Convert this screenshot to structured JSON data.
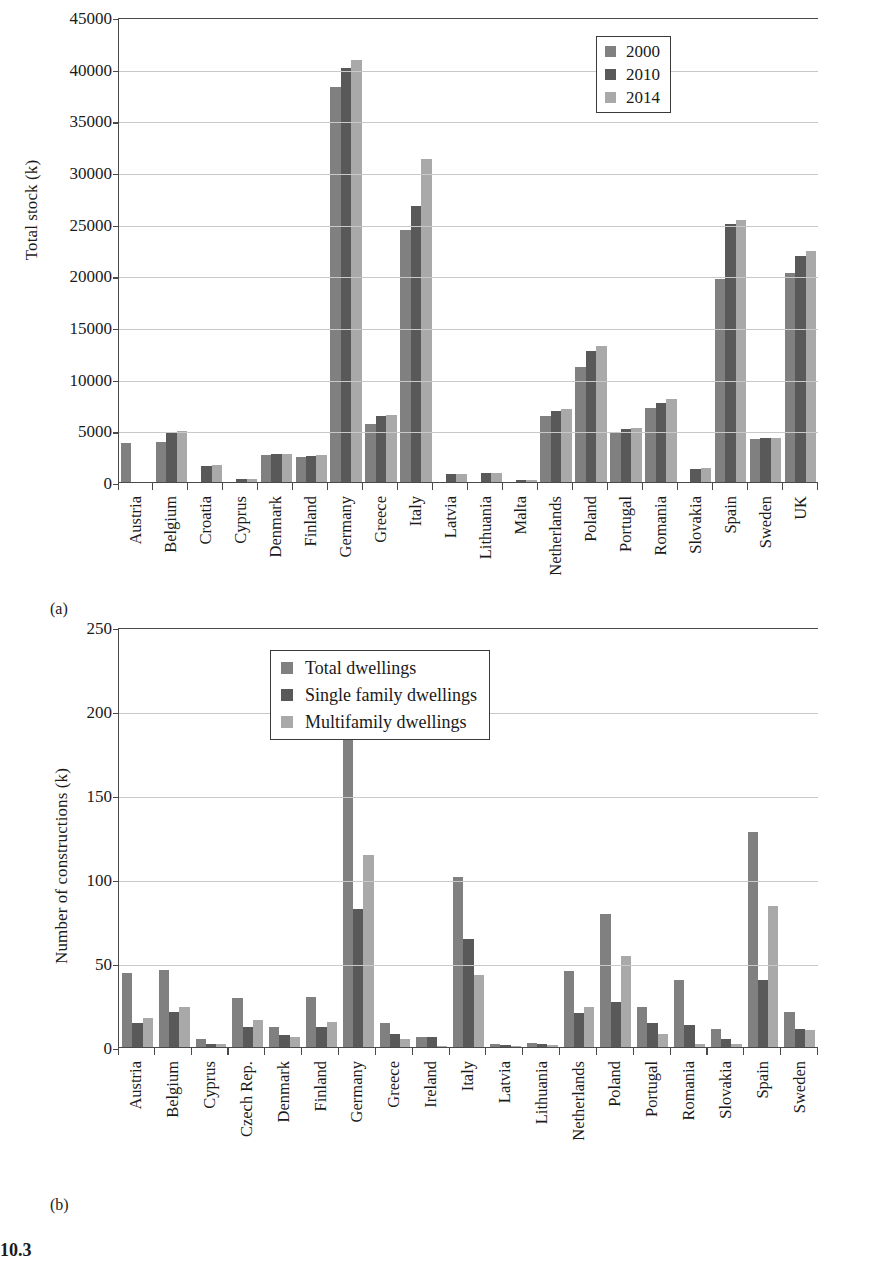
{
  "figure": {
    "number_label": "10.3",
    "subcaption_a": "(a)",
    "subcaption_b": "(b)"
  },
  "colors": {
    "series1": "#808080",
    "series2": "#595959",
    "series3": "#a9a9a9",
    "axis": "#4a4a4a",
    "grid": "#c9c9c9",
    "background": "#ffffff"
  },
  "chart_data": [
    {
      "id": "chart-a",
      "type": "bar",
      "title": "",
      "xlabel": "",
      "ylabel": "Total stock (k)",
      "ylim": [
        0,
        45000
      ],
      "yticks": [
        0,
        5000,
        10000,
        15000,
        20000,
        25000,
        30000,
        35000,
        40000,
        45000
      ],
      "ytick_labels": [
        "0",
        "5000",
        "10000",
        "15000",
        "20000",
        "25000",
        "30000",
        "35000",
        "40000",
        "45000"
      ],
      "grid": true,
      "legend_position": "top-right",
      "categories": [
        "Austria",
        "Belgium",
        "Croatia",
        "Cyprus",
        "Denmark",
        "Finland",
        "Germany",
        "Greece",
        "Italy",
        "Latvia",
        "Lithuania",
        "Malta",
        "Netherlands",
        "Poland",
        "Portugal",
        "Romania",
        "Slovakia",
        "Spain",
        "Sweden",
        "UK"
      ],
      "series": [
        {
          "name": "2000",
          "color": "#808080",
          "values": [
            3800,
            3900,
            0,
            0,
            2600,
            2450,
            38200,
            5600,
            24400,
            0,
            0,
            0,
            6350,
            11100,
            4750,
            7200,
            0,
            19600,
            4200,
            20200
          ]
        },
        {
          "name": "2010",
          "color": "#595959",
          "values": [
            0,
            4700,
            1550,
            270,
            2700,
            2550,
            40100,
            6400,
            26700,
            750,
            900,
            180,
            6900,
            12700,
            5100,
            7600,
            1300,
            25000,
            4250,
            21900
          ]
        },
        {
          "name": "2014",
          "color": "#a9a9a9",
          "values": [
            0,
            4950,
            1600,
            290,
            2750,
            2600,
            40800,
            6500,
            31300,
            760,
            920,
            190,
            7100,
            13200,
            5250,
            8000,
            1320,
            25400,
            4280,
            22400
          ]
        }
      ]
    },
    {
      "id": "chart-b",
      "type": "bar",
      "title": "",
      "xlabel": "",
      "ylabel": "Number of constructions (k)",
      "ylim": [
        0,
        250
      ],
      "yticks": [
        0,
        50,
        100,
        150,
        200,
        250
      ],
      "ytick_labels": [
        "0",
        "50",
        "100",
        "150",
        "200",
        "250"
      ],
      "grid": true,
      "legend_position": "top-center",
      "categories": [
        "Austria",
        "Belgium",
        "Cyprus",
        "Czech Rep.",
        "Denmark",
        "Finland",
        "Germany",
        "Greece",
        "Ireland",
        "Italy",
        "Latvia",
        "Lithuania",
        "Netherlands",
        "Poland",
        "Portugal",
        "Romania",
        "Slovakia",
        "Spain",
        "Sweden"
      ],
      "series": [
        {
          "name": "Total dwellings",
          "color": "#808080",
          "values": [
            44,
            46,
            5,
            29,
            12,
            30,
            198,
            14,
            6,
            101,
            1.5,
            2.5,
            45,
            79,
            24,
            40,
            11,
            128,
            21
          ]
        },
        {
          "name": "Single family dwellings",
          "color": "#595959",
          "values": [
            14,
            21,
            2,
            12,
            7,
            12,
            82,
            8,
            6,
            64,
            1.2,
            2,
            20,
            27,
            14,
            13,
            5,
            40,
            11
          ]
        },
        {
          "name": "Multifamily dwellings",
          "color": "#a9a9a9",
          "values": [
            17,
            24,
            2,
            16,
            6,
            15,
            114,
            5,
            0.5,
            43,
            0.5,
            1,
            24,
            54,
            8,
            1.5,
            2,
            84,
            10
          ]
        }
      ]
    }
  ]
}
